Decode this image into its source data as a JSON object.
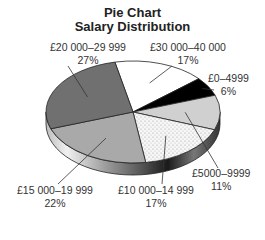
{
  "chart_data": {
    "type": "pie",
    "title": "Pie Chart",
    "subtitle": "Salary Distribution",
    "categories": [
      "£30 000–40 000",
      "£0–4999",
      "£5000–9999",
      "£10 000–14 999",
      "£15 000–19 999",
      "£20 000–29 999"
    ],
    "values": [
      17,
      6,
      11,
      17,
      22,
      27
    ],
    "unit": "%",
    "style": "3d",
    "legend": "none (direct labels)",
    "slices": [
      {
        "label": "£30 000–40 000",
        "percent": "17%",
        "value": 17,
        "color": "#ffffff"
      },
      {
        "label": "£0–4999",
        "percent": "6%",
        "value": 6,
        "color": "#000000"
      },
      {
        "label": "£5000–9999",
        "percent": "11%",
        "value": 11,
        "color": "#d0d0d0"
      },
      {
        "label": "£10 000–14 999",
        "percent": "17%",
        "value": 17,
        "color": "#f4f4f4",
        "pattern": "dots"
      },
      {
        "label": "£15 000–19 999",
        "percent": "22%",
        "value": 22,
        "color": "#a9a9a9"
      },
      {
        "label": "£20 000–29 999",
        "percent": "27%",
        "value": 27,
        "color": "#707070"
      }
    ]
  }
}
